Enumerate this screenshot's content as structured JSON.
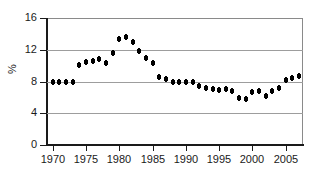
{
  "chart_data": {
    "type": "scatter",
    "title": "",
    "xlabel": "",
    "ylabel": "%",
    "xlim": [
      1969.0,
      2007.6
    ],
    "ylim": [
      0,
      16
    ],
    "xticks": [
      1970,
      1975,
      1980,
      1985,
      1990,
      1995,
      2000,
      2005
    ],
    "yticks": [
      0,
      4,
      8,
      12,
      16
    ],
    "xtick_labels": [
      "1970",
      "1975",
      "1980",
      "1985",
      "1990",
      "1995",
      "2000",
      "2005"
    ],
    "ytick_labels": [
      "0",
      "4",
      "8",
      "12",
      "16"
    ],
    "grid": "horizontal",
    "legend": "none",
    "marker_color": "#000000",
    "grid_color": "#9d9d9d",
    "axis_color": "#1a1a1a",
    "x": [
      1970,
      1971,
      1972,
      1973,
      1974,
      1975,
      1976,
      1977,
      1978,
      1979,
      1980,
      1981,
      1982,
      1983,
      1984,
      1985,
      1986,
      1987,
      1988,
      1989,
      1990,
      1991,
      1992,
      1993,
      1994,
      1995,
      1996,
      1997,
      1998,
      1999,
      2000,
      2001,
      2002,
      2003,
      2004,
      2005,
      2006,
      2007
    ],
    "values": [
      8.0,
      7.9,
      7.9,
      8.0,
      10.1,
      10.4,
      10.6,
      10.8,
      10.3,
      11.6,
      13.3,
      13.6,
      13.0,
      11.8,
      11.0,
      10.3,
      8.6,
      8.3,
      8.0,
      8.0,
      8.0,
      7.9,
      7.4,
      7.2,
      7.1,
      6.9,
      7.0,
      6.8,
      5.9,
      5.8,
      6.7,
      6.8,
      6.2,
      6.8,
      7.2,
      8.2,
      8.4,
      8.7
    ]
  }
}
